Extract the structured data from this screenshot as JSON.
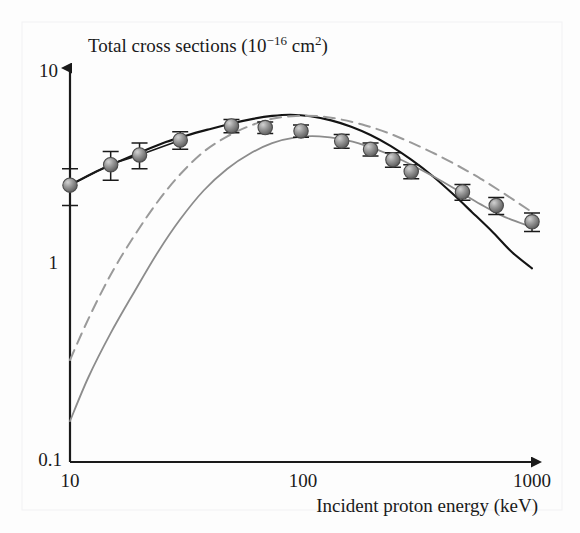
{
  "figure": {
    "background_color": "#fdfdfd",
    "panel_edge_color": "#f2f2f4"
  },
  "chart_data": {
    "type": "scatter",
    "title": "Total cross sections (10−16 cm2)",
    "title_display": "Total cross sections (10",
    "title_exponent": "−16",
    "title_units": "cm",
    "title_units_exponent": "2",
    "title_close": ")",
    "xlabel": "Incident proton energy (keV)",
    "ylabel": "",
    "xscale": "log",
    "yscale": "log",
    "xlim": [
      10,
      1000
    ],
    "ylim": [
      0.1,
      10
    ],
    "xticks": [
      10,
      100,
      1000
    ],
    "xtick_labels": [
      "10",
      "100",
      "1000"
    ],
    "yticks": [
      0.1,
      1,
      10
    ],
    "ytick_labels": [
      "0.1",
      "1",
      "10"
    ],
    "grid": false,
    "legend": "none",
    "arrow_axes": true,
    "series": [
      {
        "name": "experiment",
        "type": "scatter-with-errorbars",
        "color": "#7d7d7d",
        "marker": "sphere",
        "x": [
          10,
          15,
          20,
          30,
          50,
          70,
          100,
          150,
          200,
          250,
          300,
          500,
          700,
          1000
        ],
        "y": [
          2.55,
          3.25,
          3.65,
          4.35,
          5.15,
          5.05,
          4.85,
          4.3,
          3.9,
          3.45,
          3.0,
          2.35,
          2.0,
          1.65
        ],
        "yerr_low": [
          0.55,
          0.55,
          0.55,
          0.45,
          0.4,
          0.35,
          0.35,
          0.35,
          0.3,
          0.3,
          0.25,
          0.22,
          0.2,
          0.18
        ],
        "yerr_high": [
          0.55,
          0.55,
          0.55,
          0.45,
          0.4,
          0.35,
          0.35,
          0.35,
          0.3,
          0.3,
          0.25,
          0.22,
          0.2,
          0.18
        ]
      },
      {
        "name": "theory-solid-black",
        "type": "line",
        "style": "solid",
        "color": "#141414",
        "width": 2.1,
        "x": [
          10,
          13,
          16,
          20,
          26,
          32,
          40,
          50,
          62,
          75,
          90,
          110,
          135,
          165,
          200,
          245,
          300,
          370,
          450,
          550,
          680,
          820,
          1000
        ],
        "y": [
          2.55,
          3.0,
          3.35,
          3.75,
          4.25,
          4.6,
          4.95,
          5.3,
          5.6,
          5.8,
          5.88,
          5.78,
          5.5,
          5.1,
          4.62,
          4.05,
          3.45,
          2.85,
          2.32,
          1.85,
          1.45,
          1.15,
          0.95
        ]
      },
      {
        "name": "theory-solid-gray",
        "type": "line",
        "style": "solid",
        "color": "#8c8c8c",
        "width": 1.8,
        "x": [
          10,
          12,
          15,
          19,
          24,
          30,
          38,
          48,
          60,
          75,
          95,
          120,
          150,
          190,
          240,
          300,
          380,
          480,
          600,
          760,
          1000
        ],
        "y": [
          0.155,
          0.26,
          0.44,
          0.72,
          1.15,
          1.7,
          2.4,
          3.1,
          3.7,
          4.2,
          4.5,
          4.55,
          4.4,
          4.08,
          3.68,
          3.25,
          2.8,
          2.38,
          2.03,
          1.75,
          1.55
        ]
      },
      {
        "name": "theory-dashed-gray",
        "type": "line",
        "style": "dashed",
        "color": "#9a9a9a",
        "width": 2.0,
        "dash": "11,7",
        "x": [
          10,
          12,
          15,
          19,
          24,
          30,
          38,
          48,
          60,
          75,
          95,
          120,
          150,
          190,
          240,
          300,
          380,
          480,
          600,
          760,
          1000
        ],
        "y": [
          0.32,
          0.52,
          0.88,
          1.4,
          2.1,
          2.9,
          3.8,
          4.55,
          5.15,
          5.6,
          5.8,
          5.78,
          5.55,
          5.18,
          4.72,
          4.22,
          3.7,
          3.2,
          2.75,
          2.3,
          1.85
        ]
      }
    ]
  }
}
